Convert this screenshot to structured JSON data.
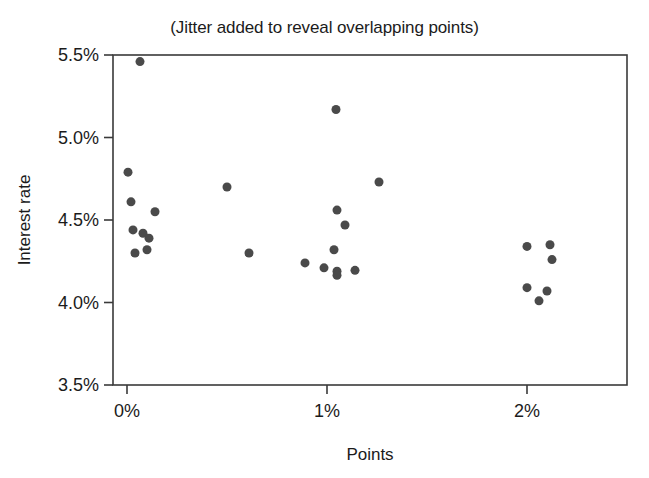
{
  "chart_data": {
    "type": "scatter",
    "title": "(Jitter added to reveal overlapping points)",
    "xlabel": "Points",
    "ylabel": "Interest rate",
    "xlim": [
      -0.07,
      2.5
    ],
    "ylim": [
      3.5,
      5.5
    ],
    "xtick_labels": [
      "0%",
      "1%",
      "2%"
    ],
    "xtick_values": [
      0,
      1,
      2
    ],
    "ytick_labels": [
      "3.5%",
      "4.0%",
      "4.5%",
      "5.0%",
      "5.5%"
    ],
    "ytick_values": [
      3.5,
      4.0,
      4.5,
      5.0,
      5.5
    ],
    "grid": false,
    "legend": false,
    "marker": "filled-circle",
    "marker_color": "#4a4a4a",
    "marker_size": 9,
    "points": [
      {
        "x": 0.065,
        "y": 5.46
      },
      {
        "x": 0.005,
        "y": 4.79
      },
      {
        "x": 0.02,
        "y": 4.61
      },
      {
        "x": 0.14,
        "y": 4.55
      },
      {
        "x": 0.03,
        "y": 4.44
      },
      {
        "x": 0.08,
        "y": 4.42
      },
      {
        "x": 0.11,
        "y": 4.39
      },
      {
        "x": 0.1,
        "y": 4.32
      },
      {
        "x": 0.04,
        "y": 4.3
      },
      {
        "x": 0.5,
        "y": 4.7
      },
      {
        "x": 0.61,
        "y": 4.3
      },
      {
        "x": 0.89,
        "y": 4.24
      },
      {
        "x": 1.045,
        "y": 5.17
      },
      {
        "x": 1.26,
        "y": 4.73
      },
      {
        "x": 1.05,
        "y": 4.56
      },
      {
        "x": 1.09,
        "y": 4.47
      },
      {
        "x": 1.035,
        "y": 4.32
      },
      {
        "x": 0.985,
        "y": 4.21
      },
      {
        "x": 1.05,
        "y": 4.19
      },
      {
        "x": 1.05,
        "y": 4.165
      },
      {
        "x": 1.14,
        "y": 4.195
      },
      {
        "x": 2.0,
        "y": 4.34
      },
      {
        "x": 2.115,
        "y": 4.35
      },
      {
        "x": 2.125,
        "y": 4.26
      },
      {
        "x": 2.0,
        "y": 4.09
      },
      {
        "x": 2.1,
        "y": 4.07
      },
      {
        "x": 2.06,
        "y": 4.01
      }
    ]
  }
}
